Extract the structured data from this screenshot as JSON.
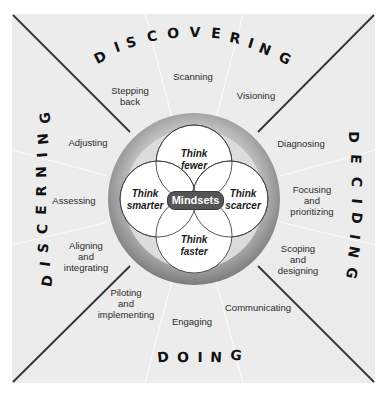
{
  "center": {
    "label": "Mindsets",
    "petals": [
      {
        "id": "top",
        "line1": "Think",
        "line2": "fewer"
      },
      {
        "id": "left",
        "line1": "Think",
        "line2": "smarter"
      },
      {
        "id": "right",
        "line1": "Think",
        "line2": "scarcer"
      },
      {
        "id": "bottom",
        "line1": "Think",
        "line2": "faster"
      }
    ]
  },
  "quadrants": {
    "top": {
      "title": "DISCOVERING",
      "items": [
        [
          "Stepping",
          "back"
        ],
        [
          "Scanning"
        ],
        [
          "Visioning"
        ]
      ]
    },
    "right": {
      "title": "DECIDING",
      "items": [
        [
          "Diagnosing"
        ],
        [
          "Focusing",
          "and",
          "prioritizing"
        ],
        [
          "Scoping",
          "and",
          "designing"
        ]
      ]
    },
    "bottom": {
      "title": "DOING",
      "items": [
        [
          "Piloting",
          "and",
          "implementing"
        ],
        [
          "Engaging"
        ],
        [
          "Communicating"
        ]
      ]
    },
    "left": {
      "title": "DISCERNING",
      "items": [
        [
          "Adjusting"
        ],
        [
          "Assessing"
        ],
        [
          "Aligning",
          "and",
          "integrating"
        ]
      ]
    }
  },
  "colors": {
    "panel_bg": "#ececec",
    "diagonal": "#333333",
    "divider": "#fafafa",
    "ring_outer": "#8a8a8a",
    "ring_inner": "#d8d8d8",
    "petal_fill": "#ffffff",
    "badge_bg": "#555555"
  }
}
